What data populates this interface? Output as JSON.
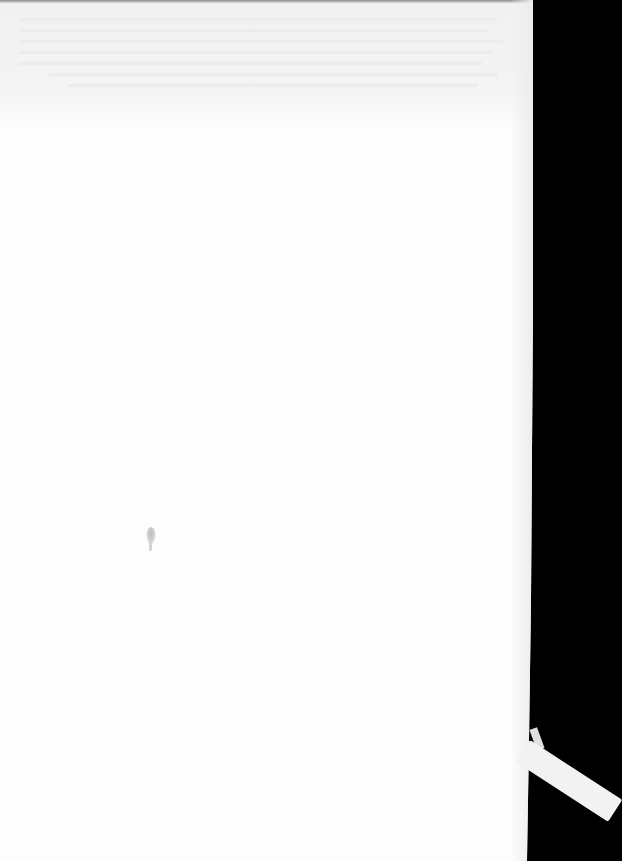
{
  "document": {
    "type": "scanned-blank-page",
    "visible_text": "",
    "colors": {
      "paper": "#fdfdfd",
      "background": "#000000",
      "bleed_through": "#f1f1f1",
      "smudge": "#bdbdbd",
      "ribbon": "#f2f2f2"
    }
  }
}
